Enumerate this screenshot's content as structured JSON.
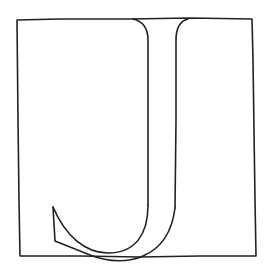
{
  "illustration": {
    "subject": "letter J inside a square frame",
    "letter": "J",
    "style": "hand-drawn line art",
    "colors": {
      "background": "#ffffff",
      "ink": "#222222"
    },
    "stroke_width": 1.6
  }
}
